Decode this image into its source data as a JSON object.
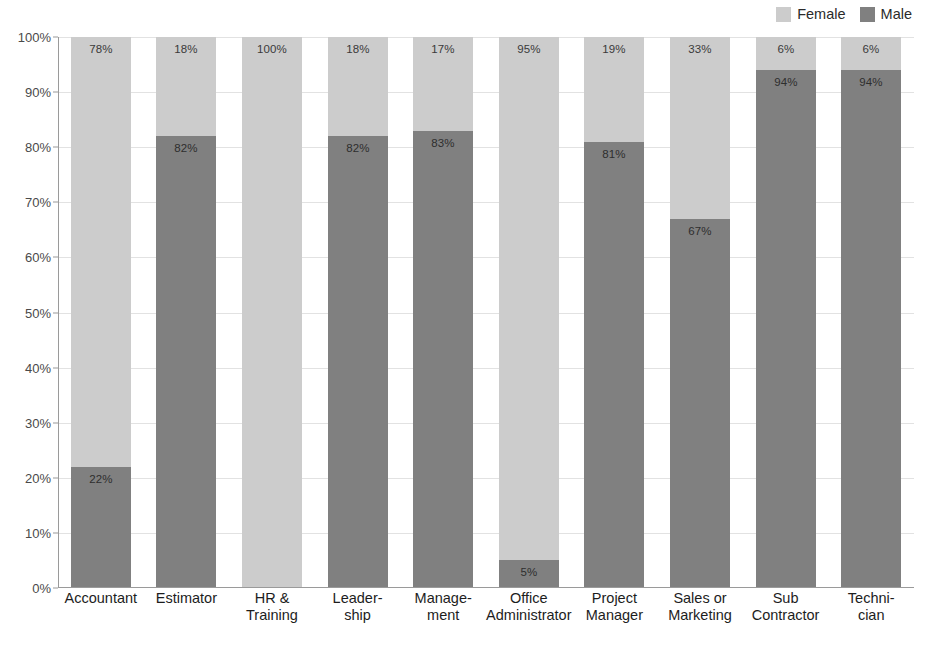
{
  "chart_data": {
    "type": "bar",
    "subtype": "100% stacked bar",
    "title": "",
    "subtitle": "",
    "xlabel": "",
    "ylabel": "",
    "ylim": [
      0,
      100
    ],
    "y_unit": "%",
    "grid": true,
    "legend_position": "top-right",
    "categories": [
      "Accountant",
      "Estimator",
      "HR &\nTraining",
      "Leader-\nship",
      "Manage-\nment",
      "Office\nAdministrator",
      "Project\nManager",
      "Sales or\nMarketing",
      "Sub\nContractor",
      "Techni-\ncian"
    ],
    "ytick_labels": [
      "100%",
      "90%",
      "80%",
      "70%",
      "60%",
      "50%",
      "40%",
      "30%",
      "20%",
      "10%",
      "0%"
    ],
    "ytick_values": [
      100,
      90,
      80,
      70,
      60,
      50,
      40,
      30,
      20,
      10,
      0
    ],
    "series": [
      {
        "name": "Male",
        "color": "#808080",
        "values": [
          22,
          82,
          0,
          82,
          83,
          5,
          81,
          67,
          94,
          94
        ],
        "labels": [
          "22%",
          "82%",
          "",
          "82%",
          "83%",
          "5%",
          "81%",
          "67%",
          "94%",
          "94%"
        ]
      },
      {
        "name": "Female",
        "color": "#cccccc",
        "values": [
          78,
          18,
          100,
          18,
          17,
          95,
          19,
          33,
          6,
          6
        ],
        "labels": [
          "78%",
          "18%",
          "100%",
          "18%",
          "17%",
          "95%",
          "19%",
          "33%",
          "6%",
          "6%"
        ]
      }
    ]
  },
  "legend": {
    "items": [
      {
        "label": "Female",
        "color": "#cccccc"
      },
      {
        "label": "Male",
        "color": "#808080"
      }
    ]
  },
  "colors": {
    "female": "#cccccc",
    "male": "#808080",
    "gridline": "#e2e2e2",
    "axis": "#9a9a9a",
    "tick_text": "#4a4a4a",
    "category_text": "#1d1d1d",
    "background": "#ffffff"
  }
}
